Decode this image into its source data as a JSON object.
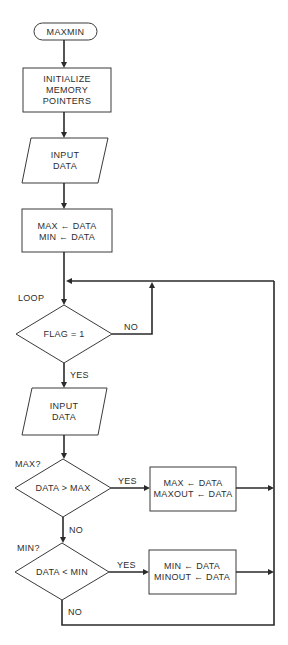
{
  "flowchart": {
    "start": {
      "label": "MAXMIN"
    },
    "init": {
      "lines": [
        "INITIALIZE",
        "MEMORY",
        "POINTERS"
      ]
    },
    "input1": {
      "lines": [
        "INPUT",
        "DATA"
      ]
    },
    "assign1": {
      "lines": [
        "MAX ← DATA",
        "MIN ← DATA"
      ]
    },
    "loop_label": "LOOP",
    "decision_flag": {
      "label": "FLAG = 1",
      "no_label": "NO",
      "yes_label": "YES"
    },
    "input2": {
      "lines": [
        "INPUT",
        "DATA"
      ]
    },
    "max_label": "MAX?",
    "decision_max": {
      "label": "DATA > MAX",
      "yes_label": "YES",
      "no_label": "NO"
    },
    "assign_max": {
      "lines": [
        "MAX ← DATA",
        "MAXOUT ← DATA"
      ]
    },
    "min_label": "MIN?",
    "decision_min": {
      "label": "DATA < MIN",
      "yes_label": "YES",
      "no_label": "NO"
    },
    "assign_min": {
      "lines": [
        "MIN ← DATA",
        "MINOUT ← DATA"
      ]
    }
  },
  "colors": {
    "stroke": "#2a2a2a",
    "text": "#2e2e2e",
    "background": "#ffffff"
  }
}
